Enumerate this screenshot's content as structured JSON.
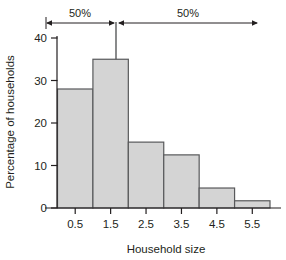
{
  "chart_data": {
    "type": "bar",
    "title": "",
    "subtitle": "",
    "xlabel": "Household size",
    "ylabel": "Percentage of households",
    "categories": [
      "0.5",
      "1.5",
      "2.5",
      "3.5",
      "4.5",
      "5.5"
    ],
    "values": [
      28,
      35,
      15.5,
      12.5,
      4.7,
      1.7
    ],
    "xlim": [
      0,
      6
    ],
    "ylim": [
      0,
      42
    ],
    "yticks": [
      "0",
      "10",
      "20",
      "30",
      "40"
    ],
    "ytick_values": [
      0,
      10,
      20,
      30,
      40
    ],
    "xticks": [
      "0.5",
      "1.5",
      "2.5",
      "3.5",
      "4.5",
      "5.5"
    ],
    "xtick_values": [
      0.5,
      1.5,
      2.5,
      3.5,
      4.5,
      5.5
    ],
    "grid": false,
    "legend": "none",
    "bar_fill_color": "#d4d4d4",
    "bar_edge_color": "#58595b",
    "axis_color": "#231f20",
    "annotations": [
      {
        "name": "left-half-label",
        "text": "50%"
      },
      {
        "name": "right-half-label",
        "text": "50%"
      },
      {
        "name": "median-line",
        "text": ""
      }
    ],
    "median_value": 2.15
  }
}
